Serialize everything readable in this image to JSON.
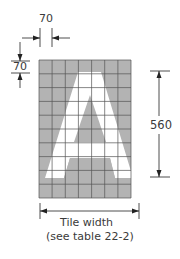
{
  "diagram": {
    "top_dimension": "70",
    "left_dimension": "70",
    "right_dimension": "560",
    "bottom_caption_line1": "Tile width",
    "bottom_caption_line2": "(see table 22-2)",
    "letter": "A",
    "grid": {
      "columns": 7,
      "rows": 10
    },
    "colors": {
      "grid_fill": "#b3b3b3",
      "grid_line": "#555555",
      "letter": "#ffffff",
      "dim_line": "#222222"
    }
  }
}
